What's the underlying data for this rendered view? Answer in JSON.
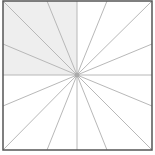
{
  "diagram": {
    "type": "radial-lines-in-square",
    "frame": {
      "x": 3,
      "y": 1,
      "width": 149,
      "height": 149,
      "stroke": "#555555",
      "stroke_width": 1.5
    },
    "shaded_region": {
      "quadrant": "top-left",
      "x": 3,
      "y": 1,
      "width": 74,
      "height": 74,
      "fill": "#eeeeee"
    },
    "center": {
      "x": 77,
      "y": 75,
      "radius": 2.5,
      "fill": "#aaaaaa"
    },
    "ray_count": 16,
    "ray_color": "#b8b8b8",
    "rays": [
      {
        "x2": 77,
        "y2": 1
      },
      {
        "x2": 107,
        "y2": 1
      },
      {
        "x2": 152,
        "y2": 1
      },
      {
        "x2": 152,
        "y2": 44
      },
      {
        "x2": 152,
        "y2": 75
      },
      {
        "x2": 152,
        "y2": 106
      },
      {
        "x2": 152,
        "y2": 150
      },
      {
        "x2": 107,
        "y2": 150
      },
      {
        "x2": 77,
        "y2": 150
      },
      {
        "x2": 47,
        "y2": 150
      },
      {
        "x2": 3,
        "y2": 150
      },
      {
        "x2": 3,
        "y2": 106
      },
      {
        "x2": 3,
        "y2": 75
      },
      {
        "x2": 3,
        "y2": 44
      },
      {
        "x2": 3,
        "y2": 1
      },
      {
        "x2": 47,
        "y2": 1
      }
    ]
  }
}
